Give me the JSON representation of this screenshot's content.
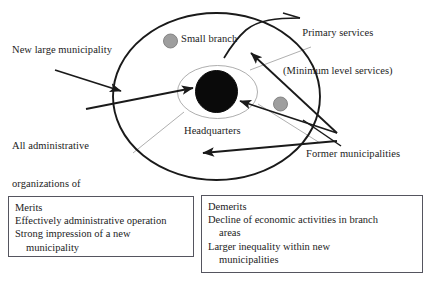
{
  "diagram": {
    "title_labels": {
      "primary_services_line1": "Primary services",
      "primary_services_line2": "(Minimum level services)",
      "small_branch": "Small branch",
      "new_large_municipality": "New large municipality",
      "all_admin_line1": "All administrative",
      "all_admin_line2": "organizations of",
      "all_admin_line3": "municipality",
      "headquarters": "Headquarters",
      "former_municipalities": "Former municipalities"
    },
    "shapes": {
      "outer_ellipse_name": "new-large-municipality-boundary",
      "inner_ellipse_name": "headquarters-area-boundary",
      "headquarters_circle_name": "headquarters-core",
      "branch_circle_1_name": "small-branch-marker-upper-left",
      "branch_circle_2_name": "small-branch-marker-right"
    },
    "colors": {
      "outline": "#1a1a1a",
      "headquarters_fill": "#0a0a0a",
      "branch_fill": "#9e9e9e",
      "branch_stroke": "#7d7d7d",
      "divider_line": "#9a9a9a",
      "box_border": "#55555f",
      "background": "#ffffff"
    }
  },
  "merits": {
    "heading": "Merits",
    "items": [
      "Effectively administrative operation",
      "Strong impression of a new",
      "municipality"
    ]
  },
  "demerits": {
    "heading": "Demerits",
    "items": [
      "Decline of economic activities in branch",
      "areas",
      "Larger inequality within new",
      "municipalities"
    ]
  }
}
